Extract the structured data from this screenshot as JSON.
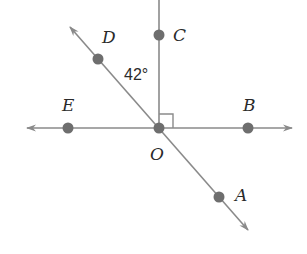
{
  "diagram": {
    "type": "geometry-angles",
    "colors": {
      "line": "#8a8a8a",
      "point": "#6e6e6e",
      "text": "#2a2a2a",
      "background": "#ffffff"
    },
    "center_point": {
      "label": "O"
    },
    "points": [
      {
        "id": "C",
        "label": "C"
      },
      {
        "id": "D",
        "label": "D"
      },
      {
        "id": "E",
        "label": "E"
      },
      {
        "id": "B",
        "label": "B"
      },
      {
        "id": "A",
        "label": "A"
      },
      {
        "id": "O",
        "label": "O"
      }
    ],
    "lines": [
      {
        "name": "line-EB",
        "through": [
          "E",
          "O",
          "B"
        ],
        "arrows": "both"
      },
      {
        "name": "line-DA",
        "through": [
          "D",
          "O",
          "A"
        ],
        "arrows": "both"
      },
      {
        "name": "ray-OC",
        "through": [
          "O",
          "C"
        ],
        "arrows": "none"
      }
    ],
    "angle_label": "42°",
    "angle_between": [
      "D",
      "O",
      "C"
    ],
    "right_angle_between": [
      "C",
      "O",
      "B"
    ]
  }
}
